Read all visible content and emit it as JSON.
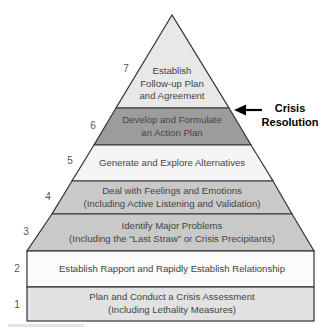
{
  "diagram": {
    "type": "pyramid",
    "colors": {
      "stroke": "#333333",
      "level_7": "#e8e8e8",
      "level_6": "#9c9c9c",
      "level_5": "#f5f5f5",
      "level_4": "#c9c9c9",
      "level_3": "#c9c9c9",
      "level_2": "#fbfbfb",
      "level_1": "#e2e2e2"
    },
    "levels": [
      {
        "number": "7",
        "line1": "Establish",
        "line2": "Follow-up Plan",
        "line3": "and Agreement"
      },
      {
        "number": "6",
        "line1": "Develop and Formulate",
        "line2": "an Action Plan"
      },
      {
        "number": "5",
        "line1": "Generate and Explore Alternatives"
      },
      {
        "number": "4",
        "line1": "Deal with Feelings and Emotions",
        "line2": "(Including Active Listening and Validation)"
      },
      {
        "number": "3",
        "line1": "Identify Major Problems",
        "line2": "(Including the “Last Straw” or Crisis Precipitants)"
      },
      {
        "number": "2",
        "line1": "Establish Rapport and Rapidly Establish Relationship"
      },
      {
        "number": "1",
        "line1": "Plan and Conduct a Crisis Assessment",
        "line2": "(Including Lethality Measures)"
      }
    ],
    "callout": {
      "line1": "Crisis",
      "line2": "Resolution",
      "arrow_icon": "arrow-left-icon"
    }
  }
}
